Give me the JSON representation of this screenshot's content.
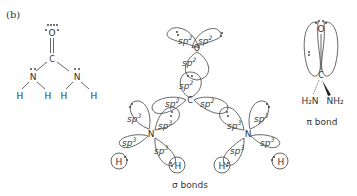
{
  "panel_label": "(b)",
  "lewis_structure": {
    "atoms": {
      "oxygen": "O",
      "carbon": "C",
      "nitrogen_left": "N",
      "nitrogen_right": "N",
      "h1": "H",
      "h2": "H",
      "h3": "H",
      "h4": "H"
    }
  },
  "sigma_diagram": {
    "caption": "σ bonds",
    "atoms": {
      "oxygen": "O",
      "carbon": "C",
      "nitrogen_left": "N",
      "nitrogen_right": "N",
      "h1": "H",
      "h2": "H",
      "h3": "H",
      "h4": "H"
    },
    "hybrid_sp2": "sp",
    "hybrid_sp3": "sp",
    "sup2": "2",
    "sup3": "3"
  },
  "pi_diagram": {
    "caption": "π bond",
    "atoms": {
      "oxygen": "O",
      "carbon": "C",
      "h2n": "H₂N",
      "nh2": "NH₂"
    }
  }
}
